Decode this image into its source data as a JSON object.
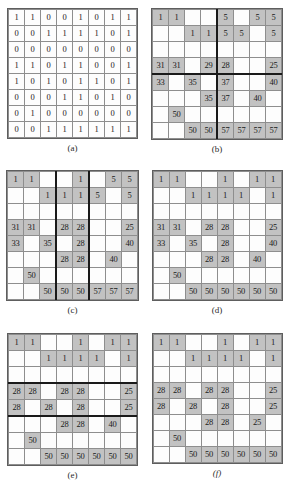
{
  "figure": {
    "panels": [
      {
        "caption": "(a)",
        "caption_italic": false,
        "shaded": false,
        "thick_cols": [],
        "thick_rows": [],
        "rows": [
          [
            "1",
            "1",
            "0",
            "0",
            "1",
            "0",
            "1",
            "1"
          ],
          [
            "0",
            "0",
            "1",
            "1",
            "1",
            "1",
            "0",
            "1"
          ],
          [
            "0",
            "0",
            "0",
            "0",
            "0",
            "0",
            "0",
            "0"
          ],
          [
            "1",
            "1",
            "0",
            "1",
            "1",
            "0",
            "0",
            "1"
          ],
          [
            "1",
            "0",
            "1",
            "0",
            "1",
            "1",
            "0",
            "1"
          ],
          [
            "0",
            "0",
            "0",
            "1",
            "1",
            "0",
            "1",
            "0"
          ],
          [
            "0",
            "1",
            "0",
            "0",
            "0",
            "0",
            "0",
            "0"
          ],
          [
            "0",
            "0",
            "1",
            "1",
            "1",
            "1",
            "1",
            "1"
          ]
        ]
      },
      {
        "caption": "(b)",
        "caption_italic": false,
        "shaded": true,
        "thick_cols": [
          4
        ],
        "thick_rows": [
          4
        ],
        "rows": [
          [
            "1",
            "1",
            "",
            "",
            "5",
            "",
            "5",
            "5"
          ],
          [
            "",
            "",
            "1",
            "1",
            "5",
            "5",
            "",
            "5"
          ],
          [
            "",
            "",
            "",
            "",
            "",
            "",
            "",
            ""
          ],
          [
            "31",
            "31",
            "",
            "29",
            "28",
            "",
            "",
            "25"
          ],
          [
            "33",
            "",
            "35",
            "",
            "37",
            "",
            "",
            "40"
          ],
          [
            "",
            "",
            "",
            "35",
            "37",
            "",
            "40",
            ""
          ],
          [
            "",
            "50",
            "",
            "",
            "",
            "",
            "",
            ""
          ],
          [
            "",
            "",
            "50",
            "50",
            "57",
            "57",
            "57",
            "57"
          ]
        ]
      },
      {
        "caption": "(c)",
        "caption_italic": false,
        "shaded": true,
        "thick_cols": [
          3,
          5
        ],
        "thick_rows": [],
        "rows": [
          [
            "1",
            "1",
            "",
            "",
            "1",
            "",
            "5",
            "5"
          ],
          [
            "",
            "",
            "1",
            "1",
            "1",
            "5",
            "",
            "5"
          ],
          [
            "",
            "",
            "",
            "",
            "",
            "",
            "",
            ""
          ],
          [
            "31",
            "31",
            "",
            "28",
            "28",
            "",
            "",
            "25"
          ],
          [
            "33",
            "",
            "35",
            "",
            "28",
            "",
            "",
            "40"
          ],
          [
            "",
            "",
            "",
            "28",
            "28",
            "",
            "40",
            ""
          ],
          [
            "",
            "50",
            "",
            "",
            "",
            "",
            "",
            ""
          ],
          [
            "",
            "",
            "50",
            "50",
            "50",
            "57",
            "57",
            "57"
          ]
        ]
      },
      {
        "caption": "(d)",
        "caption_italic": false,
        "shaded": true,
        "thick_cols": [],
        "thick_rows": [],
        "rows": [
          [
            "1",
            "1",
            "",
            "",
            "1",
            "",
            "1",
            "1"
          ],
          [
            "",
            "",
            "1",
            "1",
            "1",
            "1",
            "",
            "1"
          ],
          [
            "",
            "",
            "",
            "",
            "",
            "",
            "",
            ""
          ],
          [
            "31",
            "31",
            "",
            "28",
            "28",
            "",
            "",
            "25"
          ],
          [
            "33",
            "",
            "35",
            "",
            "28",
            "",
            "",
            "40"
          ],
          [
            "",
            "",
            "",
            "28",
            "28",
            "",
            "40",
            ""
          ],
          [
            "",
            "50",
            "",
            "",
            "",
            "",
            "",
            ""
          ],
          [
            "",
            "",
            "50",
            "50",
            "50",
            "50",
            "50",
            "50"
          ]
        ]
      },
      {
        "caption": "(e)",
        "caption_italic": false,
        "shaded": true,
        "thick_cols": [],
        "thick_rows": [
          3,
          5
        ],
        "rows": [
          [
            "1",
            "1",
            "",
            "",
            "1",
            "",
            "1",
            "1"
          ],
          [
            "",
            "",
            "1",
            "1",
            "1",
            "1",
            "",
            "1"
          ],
          [
            "",
            "",
            "",
            "",
            "",
            "",
            "",
            ""
          ],
          [
            "28",
            "28",
            "",
            "28",
            "28",
            "",
            "",
            "25"
          ],
          [
            "28",
            "",
            "28",
            "",
            "28",
            "",
            "",
            "25"
          ],
          [
            "",
            "",
            "",
            "28",
            "28",
            "",
            "40",
            ""
          ],
          [
            "",
            "50",
            "",
            "",
            "",
            "",
            "",
            ""
          ],
          [
            "",
            "",
            "50",
            "50",
            "50",
            "50",
            "50",
            "50"
          ]
        ]
      },
      {
        "caption": "(f)",
        "caption_italic": true,
        "shaded": true,
        "thick_cols": [],
        "thick_rows": [],
        "rows": [
          [
            "1",
            "1",
            "",
            "",
            "1",
            "",
            "1",
            "1"
          ],
          [
            "",
            "",
            "1",
            "1",
            "1",
            "1",
            "",
            "1"
          ],
          [
            "",
            "",
            "",
            "",
            "",
            "",
            "",
            ""
          ],
          [
            "28",
            "28",
            "",
            "28",
            "28",
            "",
            "",
            "25"
          ],
          [
            "28",
            "",
            "28",
            "",
            "28",
            "",
            "",
            "25"
          ],
          [
            "",
            "",
            "",
            "28",
            "28",
            "",
            "25",
            ""
          ],
          [
            "",
            "50",
            "",
            "",
            "",
            "",
            "",
            ""
          ],
          [
            "",
            "",
            "50",
            "50",
            "50",
            "50",
            "50",
            "50"
          ]
        ]
      }
    ]
  }
}
